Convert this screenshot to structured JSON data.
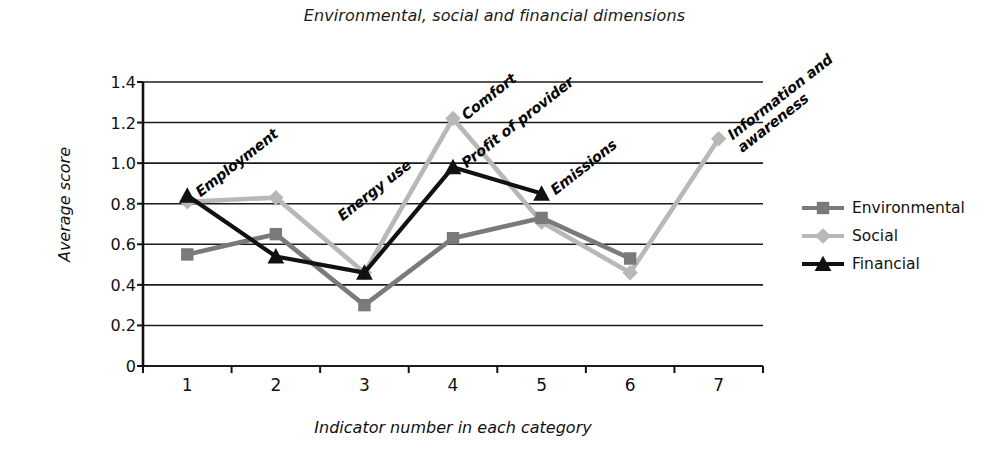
{
  "chart_data": {
    "type": "line",
    "title": "Environmental, social and financial dimensions",
    "xlabel": "Indicator number in each category",
    "ylabel": "Average score",
    "x": [
      1,
      2,
      3,
      4,
      5,
      6,
      7
    ],
    "xticklabels": [
      "1",
      "2",
      "3",
      "4",
      "5",
      "6",
      "7"
    ],
    "yticklabels": [
      "0",
      "0.2",
      "0.4",
      "0.6",
      "0.8",
      "1.0",
      "1.2",
      "1.4"
    ],
    "yticks": [
      0,
      0.2,
      0.4,
      0.6,
      0.8,
      1.0,
      1.2,
      1.4
    ],
    "ylim": [
      0,
      1.4
    ],
    "xlim": [
      0.5,
      7.5
    ],
    "grid": "horizontal",
    "legend_position": "right",
    "series": [
      {
        "name": "Environmental",
        "color": "#7a7a7a",
        "marker": "square",
        "x": [
          1,
          2,
          3,
          4,
          5,
          6
        ],
        "values": [
          0.55,
          0.65,
          0.3,
          0.63,
          0.73,
          0.53
        ]
      },
      {
        "name": "Social",
        "color": "#b8b8b8",
        "marker": "diamond",
        "x": [
          1,
          2,
          3,
          4,
          5,
          6,
          7
        ],
        "values": [
          0.81,
          0.83,
          0.46,
          1.22,
          0.71,
          0.46,
          1.12
        ]
      },
      {
        "name": "Financial",
        "color": "#111111",
        "marker": "triangle",
        "x": [
          1,
          2,
          3,
          4,
          5
        ],
        "values": [
          0.84,
          0.54,
          0.46,
          0.98,
          0.85
        ]
      }
    ],
    "annotations": [
      {
        "text": "Employment",
        "x": 1,
        "y": 0.84
      },
      {
        "text": "Energy use",
        "x": 2.6,
        "y": 0.72
      },
      {
        "text": "Comfort",
        "x": 4,
        "y": 1.22
      },
      {
        "text": "Profit of provider",
        "x": 4,
        "y": 0.98
      },
      {
        "text": "Emissions",
        "x": 5,
        "y": 0.85
      },
      {
        "text": "Information and\nawareness",
        "x": 7,
        "y": 1.12
      }
    ]
  },
  "legend": {
    "items": [
      {
        "label": "Environmental"
      },
      {
        "label": "Social"
      },
      {
        "label": "Financial"
      }
    ]
  }
}
